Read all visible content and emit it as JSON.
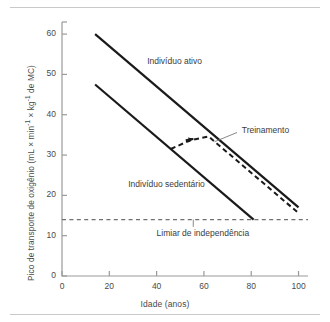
{
  "figure": {
    "type": "line-chart-figure",
    "background": "#ffffff",
    "rules": [
      "top-rule",
      "bottom-rule"
    ]
  },
  "chart_data": {
    "type": "line",
    "title": "",
    "xlabel": "Idade (anos)",
    "ylabel": "Pico de transporte de oxigênio (mL × min-1 × kg-1 de MC)",
    "ylabel_parts": {
      "lead": "Pico de transporte de oxigênio (mL × min",
      "sup1": "-1",
      "mid": " × kg",
      "sup2": "-1",
      "tail": " de MC)"
    },
    "xlim": [
      0,
      104
    ],
    "ylim": [
      0,
      63
    ],
    "xticks": [
      0,
      20,
      40,
      60,
      80,
      100
    ],
    "yticks": [
      0,
      10,
      20,
      30,
      40,
      50,
      60
    ],
    "xtick_labels": [
      "0",
      "20",
      "40",
      "60",
      "80",
      "100"
    ],
    "ytick_labels": [
      "0",
      "10",
      "20",
      "30",
      "40",
      "50",
      "60"
    ],
    "grid": false,
    "legend": "none",
    "series": [
      {
        "name": "Indivíduo ativo",
        "style": "solid",
        "color": "#1a1a1a",
        "width": 2.2,
        "points": [
          [
            14,
            60
          ],
          [
            100,
            17
          ]
        ]
      },
      {
        "name": "Indivíduo sedentário",
        "style": "solid",
        "color": "#1a1a1a",
        "width": 2.2,
        "points": [
          [
            14,
            47.5
          ],
          [
            81,
            14
          ]
        ]
      },
      {
        "name": "Treinamento",
        "style": "dashed",
        "color": "#1a1a1a",
        "width": 2.0,
        "points": [
          [
            46,
            31.5
          ],
          [
            54,
            33.6
          ],
          [
            62,
            34.6
          ],
          [
            100,
            15.6
          ]
        ],
        "has_arrowhead": true,
        "arrow_at": [
          55.5,
          34.0
        ]
      },
      {
        "name": "Limiar de independência",
        "style": "dashed",
        "color": "#6f6f6f",
        "width": 1.3,
        "points": [
          [
            0,
            14
          ],
          [
            104,
            14
          ]
        ]
      }
    ],
    "annotations": [
      {
        "name": "active-label",
        "text": "Indivíduo ativo",
        "x": 36,
        "y": 53
      },
      {
        "name": "sedentary-label",
        "text": "Indivíduo sedentário",
        "x": 28,
        "y": 22.5
      },
      {
        "name": "training-label",
        "text": "Treinamento",
        "x": 76,
        "y": 36
      },
      {
        "name": "threshold-label",
        "text": "Limiar de independência",
        "x": 40,
        "y": 10.5
      }
    ],
    "leaders": [
      {
        "name": "training-leader",
        "from": [
          74,
          35.6
        ],
        "to": [
          64.5,
          33.3
        ]
      },
      {
        "name": "threshold-leader",
        "from": [
          55.5,
          14
        ],
        "to": [
          55.5,
          12.2
        ]
      }
    ]
  }
}
